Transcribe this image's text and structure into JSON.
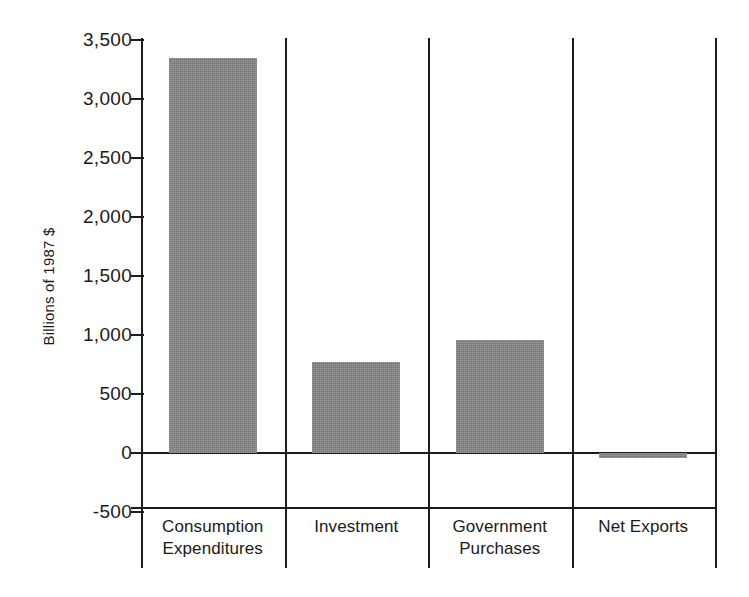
{
  "chart_data": {
    "type": "bar",
    "title": "",
    "subtitle": "",
    "xlabel": "",
    "ylabel": "Billions of 1987 $",
    "categories": [
      "Consumption Expenditures",
      "Investment",
      "Government Purchases",
      "Net Exports"
    ],
    "category_lines": [
      [
        "Consumption",
        "Expenditures"
      ],
      [
        "Investment",
        ""
      ],
      [
        "Government",
        "Purchases"
      ],
      [
        "Net Exports",
        ""
      ]
    ],
    "values": [
      3350,
      770,
      955,
      -40
    ],
    "ylim": [
      -500,
      3500
    ],
    "ytick_values": [
      3500,
      3000,
      2500,
      2000,
      1500,
      1000,
      500,
      0,
      -500
    ],
    "ytick_labels": [
      "3,500",
      "3,000",
      "2,500",
      "2,000",
      "1,500",
      "1,000",
      "500",
      "0",
      "-500"
    ],
    "grid": false,
    "legend": "none",
    "bar_color": "#808080",
    "axis_color": "#1c1c1c",
    "background_color": "#ffffff"
  },
  "axis": {
    "y_title": "Billions of 1987 $"
  }
}
